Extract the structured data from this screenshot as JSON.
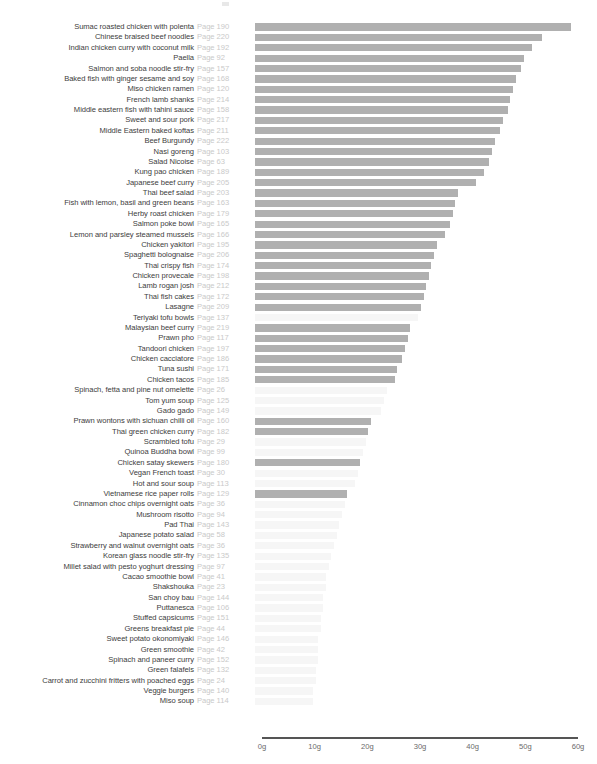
{
  "chart_data": {
    "type": "bar",
    "orientation": "horizontal",
    "title": "",
    "subtitle": "",
    "xlabel": "",
    "ylabel": "",
    "xlim": [
      0,
      60
    ],
    "xticks": [
      0,
      10,
      20,
      30,
      40,
      50,
      60
    ],
    "xtick_labels": [
      "0g",
      "10g",
      "20g",
      "30g",
      "40g",
      "50g",
      "60g"
    ],
    "grid": false,
    "legend": "none",
    "unit": "g",
    "colors": {
      "bar_dark": "#b0b0b0",
      "bar_light": "#f6f6f6",
      "axis_line": "#555555",
      "label_text": "#3d3d3d",
      "page_text": "#c9c9c9",
      "tick_text": "#6b6b6b",
      "background": "#ffffff"
    },
    "categories": [
      "Sumac roasted chicken with polenta",
      "Chinese braised beef noodles",
      "Indian chicken curry with coconut milk",
      "Paella",
      "Salmon and soba noodle stir-fry",
      "Baked fish with ginger sesame and soy",
      "Miso chicken ramen",
      "French lamb shanks",
      "Middle eastern fish with tahini sauce",
      "Sweet and sour pork",
      "Middle Eastern baked koftas",
      "Beef Burgundy",
      "Nasi goreng",
      "Salad Nicoise",
      "Kung pao chicken",
      "Japanese beef curry",
      "Thai beef salad",
      "Fish with lemon, basil and green beans",
      "Herby roast chicken",
      "Salmon poke bowl",
      "Lemon and parsley steamed mussels",
      "Chicken yakitori",
      "Spaghetti bolognaise",
      "Thai crispy fish",
      "Chicken provecale",
      "Lamb rogan josh",
      "Thai fish cakes",
      "Lasagne",
      "Teriyaki tofu bowls",
      "Malaysian beef curry",
      "Prawn pho",
      "Tandoori chicken",
      "Chicken cacciatore",
      "Tuna sushi",
      "Chicken tacos",
      "Spinach, fetta and pine nut omelette",
      "Tom yum soup",
      "Gado gado",
      "Prawn wontons with sichuan chilli oil",
      "Thai green chicken curry",
      "Scrambled tofu",
      "Quinoa Buddha bowl",
      "Chicken satay skewers",
      "Vegan French toast",
      "Hot and sour soup",
      "Vietnamese rice paper rolls",
      "Cinnamon choc chips overnight oats",
      "Mushroom risotto",
      "Pad Thai",
      "Japanese potato salad",
      "Strawberry and walnut overnight oats",
      "Korean glass noodle stir-fry",
      "Millet salad with pesto yoghurt dressing",
      "Cacao smoothie bowl",
      "Shakshouka",
      "San choy bau",
      "Puttanesca",
      "Stuffed capsicums",
      "Greens breakfast pie",
      "Sweet potato okonomiyaki",
      "Green smoothie",
      "Spinach and paneer curry",
      "Green falafels",
      "Carrot and zucchini fritters with poached eggs",
      "Veggie burgers",
      "Miso soup"
    ],
    "pages": [
      "Page 190",
      "Page 220",
      "Page 192",
      "Page 92",
      "Page 157",
      "Page 168",
      "Page 120",
      "Page 214",
      "Page 158",
      "Page 217",
      "Page 211",
      "Page 222",
      "Page 103",
      "Page 63",
      "Page 189",
      "Page 205",
      "Page 203",
      "Page 163",
      "Page 179",
      "Page 165",
      "Page 166",
      "Page 195",
      "Page 206",
      "Page 174",
      "Page 198",
      "Page 212",
      "Page 172",
      "Page 209",
      "Page 137",
      "Page 219",
      "Page 117",
      "Page 197",
      "Page 186",
      "Page 171",
      "Page 185",
      "Page 26",
      "Page 125",
      "Page 149",
      "Page 160",
      "Page 182",
      "Page 29",
      "Page 99",
      "Page 180",
      "Page 30",
      "Page 113",
      "Page 129",
      "Page 36",
      "Page 94",
      "Page 143",
      "Page 58",
      "Page 36",
      "Page 135",
      "Page 97",
      "Page 41",
      "Page 23",
      "Page 144",
      "Page 106",
      "Page 151",
      "Page 44",
      "Page 146",
      "Page 42",
      "Page 152",
      "Page 132",
      "Page 24",
      "Page 140",
      "Page 114"
    ],
    "values": [
      60.0,
      54.5,
      52.5,
      51.0,
      50.5,
      49.5,
      49.0,
      48.5,
      48.0,
      47.0,
      46.5,
      45.5,
      45.0,
      44.5,
      43.5,
      42.0,
      38.5,
      38.0,
      37.5,
      37.0,
      36.0,
      34.5,
      34.0,
      33.5,
      33.0,
      32.5,
      32.0,
      31.5,
      31.0,
      29.5,
      29.0,
      28.5,
      28.0,
      27.0,
      26.5,
      25.0,
      24.5,
      24.0,
      22.0,
      21.5,
      21.0,
      20.5,
      20.0,
      19.5,
      19.0,
      17.5,
      17.0,
      16.5,
      16.0,
      15.5,
      15.0,
      14.5,
      14.0,
      13.5,
      13.5,
      13.0,
      13.0,
      12.5,
      12.5,
      12.0,
      12.0,
      12.0,
      11.5,
      11.5,
      11.0,
      11.0
    ],
    "shades": [
      "dark",
      "dark",
      "dark",
      "dark",
      "dark",
      "dark",
      "dark",
      "dark",
      "dark",
      "dark",
      "dark",
      "dark",
      "dark",
      "dark",
      "dark",
      "dark",
      "dark",
      "dark",
      "dark",
      "dark",
      "dark",
      "dark",
      "dark",
      "dark",
      "dark",
      "dark",
      "dark",
      "dark",
      "light",
      "dark",
      "dark",
      "dark",
      "dark",
      "dark",
      "dark",
      "light",
      "light",
      "light",
      "dark",
      "dark",
      "light",
      "light",
      "dark",
      "light",
      "light",
      "dark",
      "light",
      "light",
      "light",
      "light",
      "light",
      "light",
      "light",
      "light",
      "light",
      "light",
      "light",
      "light",
      "light",
      "light",
      "light",
      "light",
      "light",
      "light",
      "light",
      "light"
    ]
  }
}
